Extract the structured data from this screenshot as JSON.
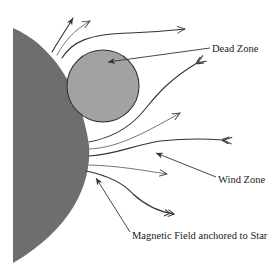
{
  "diagram": {
    "labels": {
      "dead_zone": "Dead Zone",
      "wind_zone": "Wind Zone",
      "magnetic_field": "Magnetic Field anchored to Star"
    },
    "colors": {
      "star": "#6e6e6e",
      "dead_zone": "#a2a2a2",
      "lines": "#333333",
      "background": "#ffffff"
    },
    "elements": {
      "star": "Star (half disk on left)",
      "dead_zone_circle": "Dead zone region (closed field loops)",
      "field_lines": "Open magnetic field lines carrying stellar wind"
    }
  }
}
